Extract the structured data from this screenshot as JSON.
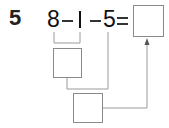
{
  "problem": {
    "number": "5",
    "expression": {
      "operand1": "8",
      "op1": "−",
      "operand2": "1",
      "op2": "−",
      "operand3": "5",
      "equals": "="
    },
    "answer_box": "",
    "step1_box": "",
    "step2_box": ""
  },
  "colors": {
    "text": "#111111",
    "line": "#9a9a9a",
    "box_border": "#8a8a8a"
  }
}
